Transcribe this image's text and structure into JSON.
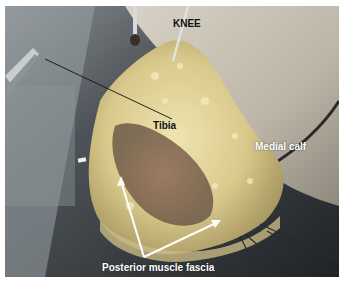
{
  "figure": {
    "labels": {
      "knee": "KNEE",
      "tibia": "Tibia",
      "medial_calf": "Medial calf",
      "posterior_muscle_fascia": "Posterior muscle fascia"
    },
    "colors": {
      "border": "#ffffff",
      "label_dark": "#111111",
      "label_light": "#ffffff",
      "fat_tissue": "#e8dca0",
      "skin": "#c9c2b4",
      "background_drape": "#55606a"
    }
  }
}
